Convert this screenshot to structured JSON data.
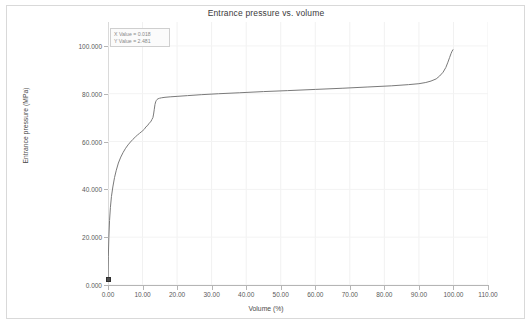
{
  "window": {
    "title": "Entrance pressure vs. volume"
  },
  "tooltip": {
    "x_line": "X Value = 0.018",
    "y_line": "Y Value = 2.481"
  },
  "chart_data": {
    "type": "line",
    "title": "Entrance pressure vs. volume",
    "xlabel": "Volume (%)",
    "ylabel": "Entrance pressure (MPa)",
    "xlim": [
      0,
      110
    ],
    "ylim": [
      0,
      110
    ],
    "grid": true,
    "legend": false,
    "xticks": [
      "0.00",
      "10.00",
      "20.00",
      "30.00",
      "40.00",
      "50.00",
      "60.00",
      "70.00",
      "80.00",
      "90.00",
      "100.00",
      "110.00"
    ],
    "xtick_values": [
      0,
      10,
      20,
      30,
      40,
      50,
      60,
      70,
      80,
      90,
      100,
      110
    ],
    "yticks": [
      "0.000",
      "20.000",
      "40.000",
      "60.000",
      "80.000",
      "100.000"
    ],
    "ytick_values": [
      0,
      20,
      40,
      60,
      80,
      100
    ],
    "line_color": "#7a7a7a",
    "marker_color": "#4d4d4d",
    "selected_point": {
      "x": 0.018,
      "y": 2.481
    },
    "series": [
      {
        "name": "Entrance pressure",
        "x": [
          0.018,
          0.1,
          0.25,
          0.45,
          0.7,
          1.0,
          1.4,
          1.9,
          2.4,
          3.0,
          3.7,
          4.4,
          5.1,
          5.8,
          6.5,
          7.2,
          7.9,
          8.5,
          9.1,
          9.6,
          10.1,
          10.6,
          11.0,
          11.4,
          11.8,
          12.1,
          12.4,
          12.7,
          13.0,
          13.2,
          13.4,
          13.6,
          13.8,
          14.0,
          14.2,
          14.5,
          14.9,
          15.5,
          16.5,
          18.0,
          20.0,
          23.0,
          27.0,
          32.0,
          38.0,
          45.0,
          52.0,
          60.0,
          68.0,
          75.0,
          82.0,
          87.0,
          90.0,
          92.0,
          93.5,
          95.0,
          96.0,
          97.0,
          97.8,
          98.4,
          98.9,
          99.3,
          99.6,
          99.85
        ],
        "y": [
          2.481,
          12.0,
          20.0,
          27.0,
          32.5,
          37.0,
          41.0,
          45.0,
          48.0,
          51.0,
          53.5,
          55.5,
          57.2,
          58.6,
          59.8,
          60.9,
          61.9,
          62.7,
          63.4,
          64.0,
          64.6,
          65.3,
          66.2,
          66.6,
          67.4,
          68.0,
          68.3,
          69.2,
          70.0,
          71.5,
          73.5,
          75.5,
          76.6,
          77.2,
          77.6,
          77.9,
          78.1,
          78.3,
          78.5,
          78.7,
          78.9,
          79.2,
          79.6,
          80.0,
          80.4,
          80.9,
          81.3,
          81.8,
          82.3,
          82.8,
          83.3,
          83.8,
          84.2,
          84.7,
          85.3,
          86.2,
          87.4,
          89.0,
          91.0,
          93.2,
          95.2,
          96.8,
          97.8,
          98.4
        ]
      }
    ]
  }
}
